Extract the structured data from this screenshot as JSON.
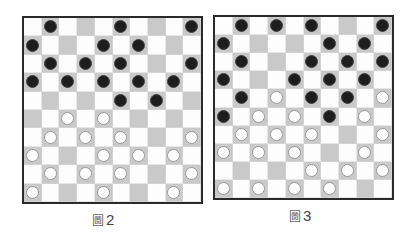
{
  "legend": {
    "b": "black-piece",
    "w": "white-piece",
    ".": "empty-square"
  },
  "colors": {
    "dark_square": "#c9c9c9",
    "light_square": "#fdfdfd",
    "black_piece": "#1e1e1e",
    "white_piece": "#ffffff",
    "border": "#2a2a2a"
  },
  "boards": [
    {
      "id": "board-1",
      "caption_prefix": "圖",
      "caption_number": "2",
      "rows": [
        ".b...b...b",
        "b...b.b...",
        ".b.b.b...b",
        "b.b.b.b.b.",
        ".....b.b..",
        "..w.w.....",
        ".w.w.w...w",
        "w...w.w.w.",
        ".w.w.w...w",
        "w...w...w."
      ]
    },
    {
      "id": "board-2",
      "caption_prefix": "圖",
      "caption_number": "3",
      "rows": [
        ".b.b.b...b",
        "b.....b.b.",
        ".b...b.b.b",
        "b...b.b.b.",
        ".b.w.b.b.w",
        "b.w.w.b.w.",
        ".w.w.w...w",
        "w.w.w...w.",
        ".....w.w.w",
        "w.w.w.w..."
      ]
    }
  ]
}
